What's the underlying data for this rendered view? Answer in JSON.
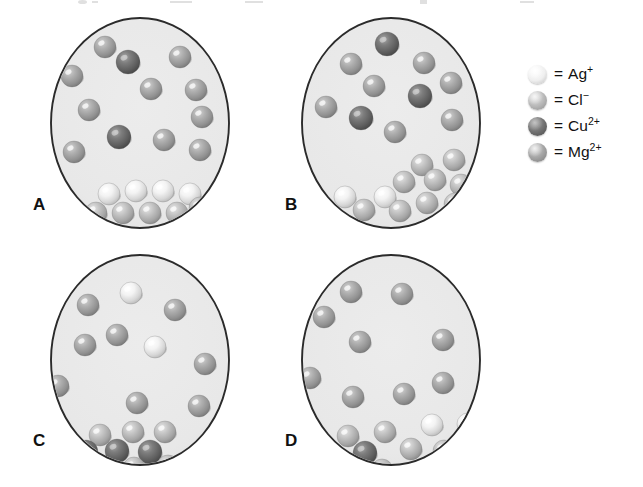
{
  "figure": {
    "background_color": "#ffffff",
    "beaker_fill_color": "#e9e9e9",
    "beaker_stroke_color": "#2b2b2b"
  },
  "ion_types": [
    {
      "key": "Ag",
      "symbol": "Ag",
      "charge": "+",
      "name": "silver ion",
      "color": "#efefef",
      "shade": "light"
    },
    {
      "key": "Cl",
      "symbol": "Cl",
      "charge": "−",
      "name": "chloride ion",
      "color": "#b6b6b6",
      "shade": "medium-light"
    },
    {
      "key": "Cu",
      "symbol": "Cu",
      "charge": "2+",
      "name": "copper(II) ion",
      "color": "#6e6e6e",
      "shade": "dark"
    },
    {
      "key": "Mg",
      "symbol": "Mg",
      "charge": "2+",
      "name": "magnesium ion",
      "color": "#a0a0a0",
      "shade": "medium"
    }
  ],
  "legend": {
    "equals": "=",
    "x": 528,
    "y": 62,
    "row_height": 26,
    "items": [
      {
        "ion": "Ag",
        "label": "Ag",
        "charge": "+",
        "color": "#efefef"
      },
      {
        "ion": "Cl",
        "label": "Cl",
        "charge": "−",
        "color": "#b6b6b6"
      },
      {
        "ion": "Cu",
        "label": "Cu",
        "charge": "2+",
        "color": "#6e6e6e"
      },
      {
        "ion": "Mg",
        "label": "Mg",
        "charge": "2+",
        "color": "#a0a0a0"
      }
    ]
  },
  "panels": [
    {
      "letter": "A",
      "letter_x": 33,
      "letter_y": 196,
      "cx": 140,
      "cy": 123,
      "rx": 89,
      "ry": 105,
      "solution_ions": [
        {
          "ion": "Mg",
          "x": 105,
          "y": 47,
          "r": 11
        },
        {
          "ion": "Cu",
          "x": 128,
          "y": 62,
          "r": 12
        },
        {
          "ion": "Mg",
          "x": 180,
          "y": 57,
          "r": 11
        },
        {
          "ion": "Mg",
          "x": 72,
          "y": 76,
          "r": 11
        },
        {
          "ion": "Mg",
          "x": 151,
          "y": 89,
          "r": 11
        },
        {
          "ion": "Mg",
          "x": 196,
          "y": 90,
          "r": 11
        },
        {
          "ion": "Mg",
          "x": 89,
          "y": 110,
          "r": 11
        },
        {
          "ion": "Mg",
          "x": 202,
          "y": 117,
          "r": 11
        },
        {
          "ion": "Cu",
          "x": 119,
          "y": 137,
          "r": 12
        },
        {
          "ion": "Mg",
          "x": 164,
          "y": 140,
          "r": 11
        },
        {
          "ion": "Mg",
          "x": 74,
          "y": 152,
          "r": 11
        },
        {
          "ion": "Mg",
          "x": 200,
          "y": 150,
          "r": 11
        }
      ],
      "precipitate": [
        {
          "ion": "Ag",
          "x": 109,
          "y": 194,
          "r": 11
        },
        {
          "ion": "Ag",
          "x": 136,
          "y": 191,
          "r": 11
        },
        {
          "ion": "Ag",
          "x": 163,
          "y": 191,
          "r": 11
        },
        {
          "ion": "Ag",
          "x": 190,
          "y": 194,
          "r": 11
        },
        {
          "ion": "Cl",
          "x": 96,
          "y": 213,
          "r": 11
        },
        {
          "ion": "Cl",
          "x": 123,
          "y": 213,
          "r": 11
        },
        {
          "ion": "Cl",
          "x": 150,
          "y": 213,
          "r": 11
        },
        {
          "ion": "Cl",
          "x": 177,
          "y": 213,
          "r": 11
        },
        {
          "ion": "Cl",
          "x": 200,
          "y": 208,
          "r": 11
        }
      ]
    },
    {
      "letter": "B",
      "letter_x": 285,
      "letter_y": 196,
      "cx": 391,
      "cy": 123,
      "rx": 89,
      "ry": 105,
      "solution_ions": [
        {
          "ion": "Cu",
          "x": 387,
          "y": 44,
          "r": 12
        },
        {
          "ion": "Mg",
          "x": 351,
          "y": 64,
          "r": 11
        },
        {
          "ion": "Mg",
          "x": 424,
          "y": 63,
          "r": 11
        },
        {
          "ion": "Mg",
          "x": 374,
          "y": 86,
          "r": 11
        },
        {
          "ion": "Mg",
          "x": 451,
          "y": 83,
          "r": 11
        },
        {
          "ion": "Cu",
          "x": 420,
          "y": 96,
          "r": 12
        },
        {
          "ion": "Mg",
          "x": 326,
          "y": 107,
          "r": 11
        },
        {
          "ion": "Cu",
          "x": 361,
          "y": 118,
          "r": 12
        },
        {
          "ion": "Mg",
          "x": 452,
          "y": 120,
          "r": 11
        },
        {
          "ion": "Mg",
          "x": 395,
          "y": 132,
          "r": 11
        }
      ],
      "precipitate": [
        {
          "ion": "Cl",
          "x": 422,
          "y": 165,
          "r": 11
        },
        {
          "ion": "Cl",
          "x": 454,
          "y": 160,
          "r": 11
        },
        {
          "ion": "Cl",
          "x": 404,
          "y": 182,
          "r": 11
        },
        {
          "ion": "Cl",
          "x": 435,
          "y": 180,
          "r": 11
        },
        {
          "ion": "Cl",
          "x": 461,
          "y": 185,
          "r": 11
        },
        {
          "ion": "Ag",
          "x": 345,
          "y": 197,
          "r": 11
        },
        {
          "ion": "Ag",
          "x": 385,
          "y": 197,
          "r": 11
        },
        {
          "ion": "Cl",
          "x": 364,
          "y": 210,
          "r": 11
        },
        {
          "ion": "Cl",
          "x": 400,
          "y": 211,
          "r": 11
        },
        {
          "ion": "Cl",
          "x": 427,
          "y": 203,
          "r": 11
        },
        {
          "ion": "Cl",
          "x": 455,
          "y": 204,
          "r": 11
        }
      ]
    },
    {
      "letter": "C",
      "letter_x": 33,
      "letter_y": 432,
      "cx": 140,
      "cy": 360,
      "rx": 89,
      "ry": 105,
      "solution_ions": [
        {
          "ion": "Ag",
          "x": 131,
          "y": 293,
          "r": 11
        },
        {
          "ion": "Mg",
          "x": 88,
          "y": 305,
          "r": 11
        },
        {
          "ion": "Mg",
          "x": 175,
          "y": 310,
          "r": 11
        },
        {
          "ion": "Mg",
          "x": 117,
          "y": 335,
          "r": 11
        },
        {
          "ion": "Mg",
          "x": 85,
          "y": 345,
          "r": 11
        },
        {
          "ion": "Ag",
          "x": 155,
          "y": 347,
          "r": 11
        },
        {
          "ion": "Mg",
          "x": 205,
          "y": 364,
          "r": 11
        },
        {
          "ion": "Mg",
          "x": 58,
          "y": 386,
          "r": 11
        },
        {
          "ion": "Mg",
          "x": 137,
          "y": 403,
          "r": 11
        },
        {
          "ion": "Mg",
          "x": 199,
          "y": 406,
          "r": 11
        }
      ],
      "precipitate": [
        {
          "ion": "Cl",
          "x": 100,
          "y": 435,
          "r": 11
        },
        {
          "ion": "Cl",
          "x": 133,
          "y": 432,
          "r": 11
        },
        {
          "ion": "Cl",
          "x": 165,
          "y": 432,
          "r": 11
        },
        {
          "ion": "Cu",
          "x": 86,
          "y": 452,
          "r": 12
        },
        {
          "ion": "Cu",
          "x": 117,
          "y": 451,
          "r": 12
        },
        {
          "ion": "Cu",
          "x": 150,
          "y": 452,
          "r": 12
        },
        {
          "ion": "Cl",
          "x": 101,
          "y": 468,
          "r": 11
        },
        {
          "ion": "Cl",
          "x": 134,
          "y": 468,
          "r": 11
        },
        {
          "ion": "Cl",
          "x": 168,
          "y": 466,
          "r": 11
        }
      ]
    },
    {
      "letter": "D",
      "letter_x": 285,
      "letter_y": 432,
      "cx": 391,
      "cy": 360,
      "rx": 89,
      "ry": 105,
      "solution_ions": [
        {
          "ion": "Mg",
          "x": 351,
          "y": 292,
          "r": 11
        },
        {
          "ion": "Mg",
          "x": 402,
          "y": 294,
          "r": 11
        },
        {
          "ion": "Mg",
          "x": 324,
          "y": 317,
          "r": 11
        },
        {
          "ion": "Mg",
          "x": 360,
          "y": 342,
          "r": 11
        },
        {
          "ion": "Mg",
          "x": 443,
          "y": 340,
          "r": 11
        },
        {
          "ion": "Mg",
          "x": 310,
          "y": 378,
          "r": 11
        },
        {
          "ion": "Mg",
          "x": 353,
          "y": 397,
          "r": 11
        },
        {
          "ion": "Mg",
          "x": 404,
          "y": 394,
          "r": 11
        },
        {
          "ion": "Mg",
          "x": 443,
          "y": 383,
          "r": 11
        }
      ],
      "precipitate": [
        {
          "ion": "Cl",
          "x": 348,
          "y": 436,
          "r": 11
        },
        {
          "ion": "Cl",
          "x": 385,
          "y": 432,
          "r": 11
        },
        {
          "ion": "Ag",
          "x": 432,
          "y": 425,
          "r": 11
        },
        {
          "ion": "Ag",
          "x": 468,
          "y": 424,
          "r": 11
        },
        {
          "ion": "Cu",
          "x": 331,
          "y": 455,
          "r": 12
        },
        {
          "ion": "Cu",
          "x": 365,
          "y": 453,
          "r": 12
        },
        {
          "ion": "Cl",
          "x": 411,
          "y": 449,
          "r": 11
        },
        {
          "ion": "Cl",
          "x": 444,
          "y": 451,
          "r": 11
        },
        {
          "ion": "Cl",
          "x": 472,
          "y": 448,
          "r": 11
        },
        {
          "ion": "Cl",
          "x": 348,
          "y": 471,
          "r": 11
        },
        {
          "ion": "Cl",
          "x": 382,
          "y": 470,
          "r": 11
        }
      ]
    }
  ]
}
